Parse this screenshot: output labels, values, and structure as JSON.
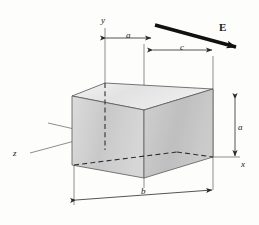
{
  "figure": {
    "background_color": "#fdfdfb",
    "line_color": "#3a3a3a",
    "field_arrow_color": "#111111",
    "box_fill_top": "#e9e9e9",
    "box_fill_front": "#d9d9d9",
    "box_fill_side": "#cfcfcf"
  },
  "axes": [
    {
      "name": "y-axis",
      "label": "y",
      "style": "italic"
    },
    {
      "name": "x-axis",
      "label": "x",
      "style": "italic"
    },
    {
      "name": "z-axis",
      "label": "z",
      "style": "italic"
    }
  ],
  "field": {
    "label": "E",
    "style": "bold",
    "description": "uniform electric field arrow pointing down-right"
  },
  "dimensions": [
    {
      "name": "dimension-a-top",
      "label": "a",
      "orientation": "horizontal",
      "position": "top-left"
    },
    {
      "name": "dimension-c-top",
      "label": "c",
      "orientation": "horizontal",
      "position": "top-right"
    },
    {
      "name": "dimension-a-right",
      "label": "a",
      "orientation": "vertical",
      "position": "right"
    },
    {
      "name": "dimension-b-bottom",
      "label": "b",
      "orientation": "horizontal",
      "position": "bottom"
    }
  ]
}
